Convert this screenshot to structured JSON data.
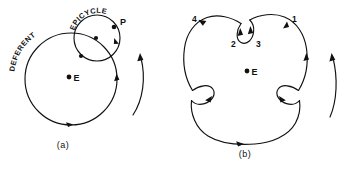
{
  "figure": {
    "name": "ptolemaic-epicycle-figure",
    "background_color": "#ffffff",
    "ink_color": "#111111",
    "width": 351,
    "height": 174
  },
  "panel_a": {
    "caption": "(a)",
    "labels": {
      "deferent": "DEFERENT",
      "epicycle": "EPICYCLE",
      "planet": "P",
      "earth": "E"
    },
    "deferent": {
      "cx": 71,
      "cy": 79,
      "r": 46
    },
    "epicycle": {
      "cx": 97,
      "cy": 38,
      "r": 23
    },
    "earth_point": {
      "cx": 69,
      "cy": 77
    },
    "planet_point": {
      "cx": 114,
      "cy": 27
    },
    "rotation_arrow": "counterclockwise-upward"
  },
  "panel_b": {
    "caption": "(b)",
    "labels": {
      "earth": "E",
      "position_1": "1",
      "position_2": "2",
      "position_3": "3",
      "position_4": "4"
    },
    "earth_point": {
      "cx": 247,
      "cy": 71
    },
    "path_type": "epicycloid-with-three-cusp-loops",
    "loop_count": 3,
    "rotation_arrow": "counterclockwise-upward"
  }
}
